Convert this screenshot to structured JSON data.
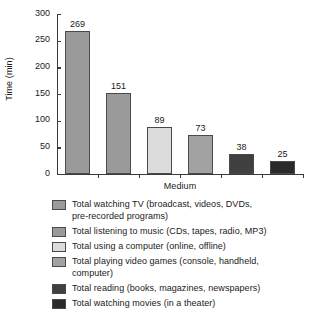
{
  "chart_data": {
    "type": "bar",
    "title": "",
    "xlabel": "Medium",
    "ylabel": "Time (min)",
    "ylim": [
      0,
      300
    ],
    "ytick_labels": [
      "300",
      "250",
      "200",
      "150",
      "100",
      "50",
      "0"
    ],
    "ytick_values": [
      300,
      250,
      200,
      150,
      100,
      50,
      0
    ],
    "ytick_step": 50,
    "grid": false,
    "legend_position": "below",
    "categories": [
      "Total watching TV (broadcast, videos, DVDs, pre-recorded programs)",
      "Total listening to music (CDs, tapes, radio, MP3)",
      "Total using a computer (online, offline)",
      "Total playing video games (console, handheld, computer)",
      "Total reading (books, magazines, newspapers)",
      "Total watching movies (in a theater)"
    ],
    "values": [
      269,
      151,
      89,
      73,
      38,
      25
    ],
    "value_labels": [
      "269",
      "151",
      "89",
      "73",
      "38",
      "25"
    ],
    "bar_colors": [
      "#9a9a9a",
      "#9a9a9a",
      "#dcdcdc",
      "#a2a2a2",
      "#404040",
      "#2a2a2a"
    ]
  },
  "legend": {
    "items": [
      {
        "label": "Total watching TV (broadcast, videos, DVDs,\npre-recorded programs)",
        "color": "#9a9a9a"
      },
      {
        "label": "Total listening to music (CDs, tapes, radio, MP3)",
        "color": "#9a9a9a"
      },
      {
        "label": "Total using a computer (online, offline)",
        "color": "#dcdcdc"
      },
      {
        "label": "Total playing video games (console, handheld,\ncomputer)",
        "color": "#a2a2a2"
      },
      {
        "label": "Total reading (books, magazines, newspapers)",
        "color": "#404040"
      },
      {
        "label": "Total watching movies (in a theater)",
        "color": "#2a2a2a"
      }
    ]
  }
}
